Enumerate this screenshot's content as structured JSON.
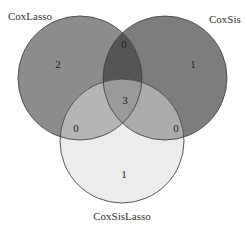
{
  "diagram": {
    "type": "venn3",
    "sets": [
      {
        "name": "CoxLasso",
        "color": "#8d8d8d"
      },
      {
        "name": "CoxSis",
        "color": "#7d7d7d"
      },
      {
        "name": "CoxSisLasso",
        "color": "#ececec"
      }
    ],
    "regions": {
      "only_CoxLasso": "2",
      "only_CoxSis": "1",
      "only_CoxSisLasso": "1",
      "CoxLasso_CoxSis": "0",
      "CoxLasso_CoxSisLasso": "0",
      "CoxSis_CoxSisLasso": "0",
      "all_three": "3"
    },
    "colors": {
      "lasso_sis_overlap": "#555555",
      "lasso_sislasso_overlap": "#b5b5b5",
      "sis_sislasso_overlap": "#ababab",
      "center": "#9a9a9a",
      "stroke": "#444444"
    }
  }
}
